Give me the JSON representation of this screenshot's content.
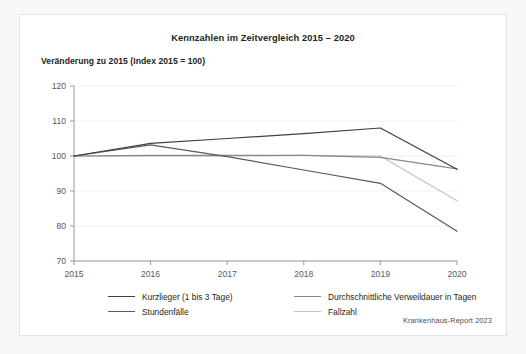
{
  "chart_data": {
    "type": "line",
    "title": "Kennzahlen im Zeitvergleich 2015 – 2020",
    "subtitle": "Veränderung zu 2015 (Index 2015 = 100)",
    "xlabel": "",
    "ylabel": "",
    "categories": [
      "2015",
      "2016",
      "2017",
      "2018",
      "2019",
      "2020"
    ],
    "x": [
      2015,
      2016,
      2017,
      2018,
      2019,
      2020
    ],
    "ylim": [
      70,
      120
    ],
    "yticks": [
      70,
      80,
      90,
      100,
      110,
      120
    ],
    "xticks": [
      "2015",
      "2016",
      "2017",
      "2018",
      "2019",
      "2020"
    ],
    "grid": true,
    "legend_position": "bottom",
    "series": [
      {
        "name": "Kurzlieger (1 bis 3 Tage)",
        "color": "#3f3f3f",
        "values": [
          100,
          103.6,
          105.0,
          106.4,
          108.0,
          96.2
        ]
      },
      {
        "name": "Stundenfälle",
        "color": "#5a5a5a",
        "values": [
          100,
          103.2,
          99.8,
          96.0,
          92.2,
          78.5
        ]
      },
      {
        "name": "Durchschnittliche Verweildauer in Tagen",
        "color": "#888888",
        "values": [
          100,
          100.2,
          100.2,
          100.2,
          99.6,
          96.3
        ]
      },
      {
        "name": "Fallzahl",
        "color": "#c3c3c3",
        "values": [
          100,
          100.0,
          100.0,
          100.2,
          100.0,
          87.2
        ]
      }
    ],
    "source": "Krankenhaus-Report 2023"
  }
}
